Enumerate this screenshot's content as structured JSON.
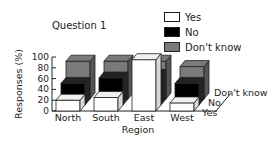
{
  "chart_data": {
    "type": "bar",
    "subtype": "3d-grouped",
    "title": "Question 1",
    "xlabel": "Region",
    "ylabel": "Responses (%)",
    "ylim": [
      0,
      100
    ],
    "yticks": [
      0,
      20,
      40,
      60,
      80,
      100
    ],
    "categories": [
      "North",
      "South",
      "East",
      "West"
    ],
    "series": [
      {
        "name": "Yes",
        "color": "#ffffff",
        "values": [
          20,
          25,
          95,
          15
        ]
      },
      {
        "name": "No",
        "color": "#000000",
        "values": [
          40,
          50,
          55,
          40
        ]
      },
      {
        "name": "Don't know",
        "color": "#7a7a7a",
        "values": [
          70,
          70,
          70,
          60
        ]
      }
    ],
    "depth_labels": [
      "Yes",
      "No",
      "Don't know"
    ],
    "legend_position": "top-right",
    "grid": false
  },
  "title": "Question 1",
  "legend": [
    {
      "label": "Yes",
      "color": "#ffffff"
    },
    {
      "label": "No",
      "color": "#000000"
    },
    {
      "label": "Don't know",
      "color": "#7a7a7a"
    }
  ],
  "axes": {
    "xlabel": "Region",
    "ylabel": "Responses (%)",
    "yticks": [
      "0",
      "20",
      "40",
      "60",
      "80",
      "100"
    ],
    "categories": [
      "North",
      "South",
      "East",
      "West"
    ],
    "depth_labels": [
      "Don't know",
      "No",
      "Yes"
    ]
  }
}
